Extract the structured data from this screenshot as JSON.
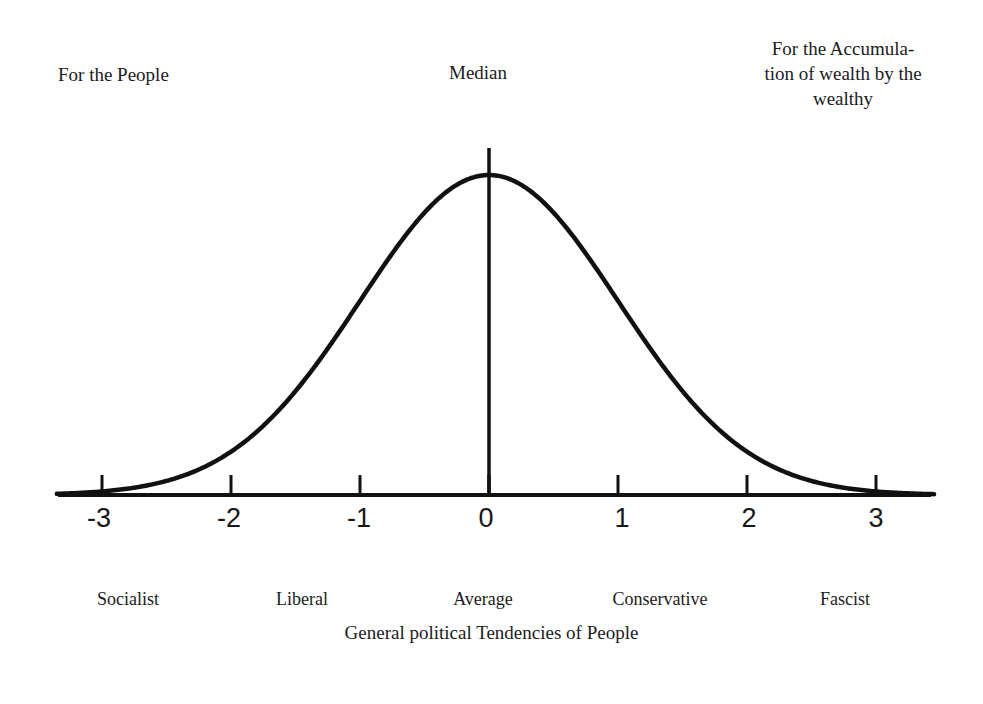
{
  "annotations": {
    "left": "For the People",
    "center": "Median",
    "right_line1": "For the Accumula-",
    "right_line2": "tion of wealth by the",
    "right_line3": "wealthy"
  },
  "caption": "General political Tendencies of People",
  "colors": {
    "ink": "#1b1b1b",
    "curve": "#111111",
    "axis": "#111111",
    "background": "#ffffff"
  },
  "chart_data": {
    "type": "line",
    "title": "",
    "subtitle": "",
    "xlabel": "General political Tendencies of People",
    "ylabel": "",
    "xlim": [
      -3.35,
      3.45
    ],
    "ylim": [
      0,
      1.06
    ],
    "grid": false,
    "legend": null,
    "distribution": {
      "name": "normal",
      "mean": 0,
      "sigma": 1,
      "peak_value": 1
    },
    "x_ticks": [
      -3,
      -2,
      -1,
      0,
      1,
      2,
      3
    ],
    "x_tick_labels": [
      "-3",
      "-2",
      "-1",
      "0",
      "1",
      "2",
      "3"
    ],
    "category_labels": [
      {
        "x": -3,
        "label": "Socialist"
      },
      {
        "x": -1.45,
        "label": "Liberal"
      },
      {
        "x": 0,
        "label": "Average"
      },
      {
        "x": 1.37,
        "label": "Conservative"
      },
      {
        "x": 2.77,
        "label": "Fascist"
      }
    ],
    "series": [
      {
        "name": "Political tendency distribution",
        "x": [
          -3.35,
          -3.0,
          -2.5,
          -2.0,
          -1.5,
          -1.0,
          -0.5,
          0.0,
          0.5,
          1.0,
          1.5,
          2.0,
          2.5,
          3.0,
          3.45
        ],
        "values": [
          0.004,
          0.011,
          0.044,
          0.135,
          0.325,
          0.607,
          0.882,
          1.0,
          0.882,
          0.607,
          0.325,
          0.135,
          0.044,
          0.011,
          0.003
        ]
      }
    ],
    "annotations": [
      {
        "name": "median-line",
        "x": 0,
        "label": "Median"
      },
      {
        "name": "left-side-note",
        "label": "For the People"
      },
      {
        "name": "right-side-note",
        "label": "For the Accumulation of wealth by the wealthy"
      }
    ]
  }
}
